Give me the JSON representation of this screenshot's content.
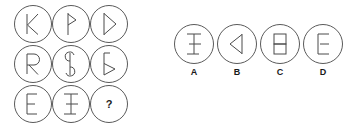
{
  "puzzle": {
    "type": "abstract-reasoning-matrix",
    "matrix": {
      "rows": 3,
      "cols": 3,
      "cells": [
        {
          "id": "r1c1",
          "glyph": "k-glyph",
          "label": "K",
          "row": 1,
          "col": 1,
          "is_question": false
        },
        {
          "id": "r1c2",
          "glyph": "thorn-half-bowl-glyph",
          "label": "Þ",
          "row": 1,
          "col": 2,
          "is_question": false
        },
        {
          "id": "r1c3",
          "glyph": "d-triangle-bowl-glyph",
          "label": "D",
          "row": 1,
          "col": 3,
          "is_question": false
        },
        {
          "id": "r2c1",
          "glyph": "r-glyph",
          "label": "R",
          "row": 2,
          "col": 1,
          "is_question": false
        },
        {
          "id": "r2c2",
          "glyph": "s-stroke-glyph",
          "label": "S",
          "row": 2,
          "col": 2,
          "is_question": false
        },
        {
          "id": "r2c3",
          "glyph": "lower-triangle-bowl-glyph",
          "label": "Ϛ",
          "row": 2,
          "col": 3,
          "is_question": false
        },
        {
          "id": "r3c1",
          "glyph": "e-glyph",
          "label": "E",
          "row": 3,
          "col": 1,
          "is_question": false
        },
        {
          "id": "r3c2",
          "glyph": "i-beam-glyph",
          "label": "I",
          "row": 3,
          "col": 2,
          "is_question": false
        },
        {
          "id": "r3c3",
          "glyph": "question-glyph",
          "label": "?",
          "row": 3,
          "col": 3,
          "is_question": true
        }
      ]
    },
    "options": [
      {
        "id": "A",
        "label": "A",
        "glyph": "i-beam-glyph",
        "name": "option-a"
      },
      {
        "id": "B",
        "label": "B",
        "glyph": "left-triangle-glyph",
        "name": "option-b"
      },
      {
        "id": "C",
        "label": "C",
        "glyph": "stacked-rectangles-glyph",
        "name": "option-c"
      },
      {
        "id": "D",
        "label": "D",
        "glyph": "e-bracket-glyph",
        "name": "option-d"
      }
    ],
    "question_mark": "?",
    "colors": {
      "background": "#ffffff",
      "circle_outline": "#5a5a5a",
      "glyph_stroke": "#4a4a4a",
      "label_text": "#1a1a1a"
    }
  }
}
